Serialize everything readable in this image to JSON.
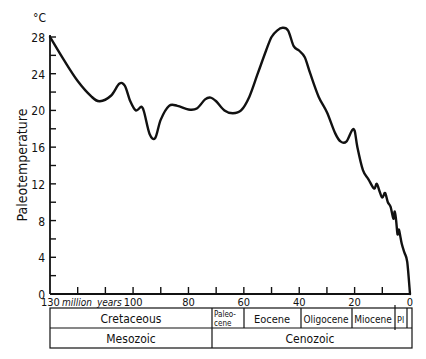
{
  "chart_data": {
    "type": "line",
    "title": "",
    "xlabel": "million years",
    "ylabel": "Paleotemperature",
    "y_unit": "°C",
    "xlim": [
      130,
      0
    ],
    "ylim": [
      0,
      28
    ],
    "x_ticks": [
      130,
      100,
      80,
      60,
      40,
      20,
      0
    ],
    "x_tick_labels": [
      "130",
      "100",
      "80",
      "60",
      "40",
      "20",
      "0"
    ],
    "y_ticks": [
      0,
      4,
      8,
      12,
      16,
      20,
      24,
      28
    ],
    "y_tick_labels": [
      "0",
      "4",
      "8",
      "12",
      "16",
      "20",
      "24",
      "28"
    ],
    "grid": false,
    "series": [
      {
        "name": "Paleotemperature",
        "x": [
          130,
          125,
          120,
          115,
          112,
          108,
          105,
          103,
          101,
          99,
          97,
          96,
          94,
          92,
          90,
          87,
          84,
          80,
          77,
          74,
          72,
          70,
          67,
          64,
          61,
          58,
          55,
          52,
          50,
          48,
          46,
          44,
          42,
          40,
          38,
          36,
          33,
          30,
          27,
          25,
          23,
          21,
          20,
          19,
          17,
          15,
          13,
          12,
          11,
          10,
          9,
          8,
          7,
          6,
          5.5,
          5,
          4.5,
          4,
          3,
          2,
          1,
          0
        ],
        "y": [
          28,
          25.5,
          23.2,
          21.5,
          21,
          21.6,
          22.9,
          22.7,
          21,
          20,
          20.4,
          19.8,
          17.4,
          17,
          19,
          20.5,
          20.5,
          20.1,
          20.2,
          21.2,
          21.4,
          21,
          20,
          19.7,
          20,
          21.5,
          24,
          26.5,
          28,
          28.7,
          29,
          28.7,
          27,
          26.5,
          25.8,
          24,
          21.5,
          19.8,
          17.5,
          16.6,
          16.6,
          17.8,
          17.8,
          16,
          13.5,
          12.5,
          11.5,
          12,
          11.2,
          10.5,
          11,
          10,
          9.5,
          8.2,
          9,
          8,
          6.5,
          7,
          5.5,
          4.5,
          3.5,
          0
        ]
      }
    ],
    "geologic_scale": {
      "epochs": [
        {
          "name": "Cretaceous",
          "from": 130,
          "to": 65
        },
        {
          "name": "Paleo-cene",
          "from": 65,
          "to": 58
        },
        {
          "name": "Eocene",
          "from": 58,
          "to": 40
        },
        {
          "name": "Oligocene",
          "from": 40,
          "to": 24
        },
        {
          "name": "Miocene",
          "from": 24,
          "to": 6
        },
        {
          "name": "Pl",
          "from": 6,
          "to": 2
        }
      ],
      "eras": [
        {
          "name": "Mesozoic",
          "from": 130,
          "to": 65
        },
        {
          "name": "Cenozoic",
          "from": 65,
          "to": 0
        }
      ]
    }
  },
  "labels": {
    "unit": "°C",
    "ylabel": "Paleotemperature",
    "x_first": "130",
    "x_unit": "million",
    "x_unit2": "years",
    "epochs": {
      "cretaceous": "Cretaceous",
      "paleocene_1": "Paleo-",
      "paleocene_2": "cene",
      "eocene": "Eocene",
      "oligocene": "Oligocene",
      "miocene": "Miocene",
      "pliocene": "Pl"
    },
    "eras": {
      "mesozoic": "Mesozoic",
      "cenozoic": "Cenozoic"
    }
  }
}
